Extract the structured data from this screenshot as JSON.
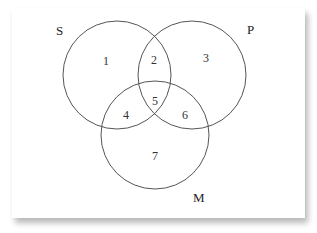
{
  "diagram": {
    "type": "venn",
    "sets": [
      {
        "label": "S",
        "cx": 117,
        "cy": 75,
        "r": 54,
        "label_x": 56,
        "label_y": 35
      },
      {
        "label": "P",
        "cx": 192,
        "cy": 75,
        "r": 54,
        "label_x": 247,
        "label_y": 34
      },
      {
        "label": "M",
        "cx": 155,
        "cy": 135,
        "r": 54,
        "label_x": 193,
        "label_y": 202
      }
    ],
    "regions": [
      {
        "label": "1",
        "x": 106,
        "y": 61
      },
      {
        "label": "2",
        "x": 154,
        "y": 60
      },
      {
        "label": "3",
        "x": 206,
        "y": 58
      },
      {
        "label": "4",
        "x": 126,
        "y": 115
      },
      {
        "label": "5",
        "x": 155,
        "y": 101
      },
      {
        "label": "6",
        "x": 185,
        "y": 115
      },
      {
        "label": "7",
        "x": 155,
        "y": 156
      }
    ],
    "colors": {
      "stroke": "#555555",
      "background": "#ffffff"
    }
  }
}
